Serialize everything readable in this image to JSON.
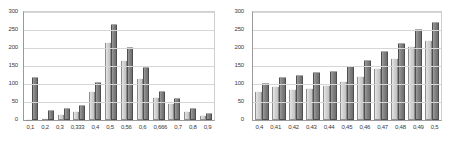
{
  "chart_data": [
    {
      "type": "bar",
      "title": "",
      "xlabel": "",
      "ylabel": "",
      "ylim": [
        0,
        300
      ],
      "yticks": [
        0,
        50,
        100,
        150,
        200,
        250,
        300
      ],
      "ytick_labels": [
        "0",
        "50",
        "100",
        "150",
        "200",
        "250",
        "300"
      ],
      "grid": true,
      "legend": "none",
      "categories": [
        "0,1",
        "0,2",
        "0,3",
        "0,333",
        "0,4",
        "0,5",
        "0,56",
        "0,6",
        "0,666",
        "0,7",
        "0,8",
        "0,9"
      ],
      "series": [
        {
          "name": "series-1",
          "color": "#d2d2d2",
          "values": [
            2,
            6,
            16,
            25,
            81,
            216,
            166,
            118,
            63,
            47,
            25,
            13
          ]
        },
        {
          "name": "series-2",
          "color": "#828282",
          "values": [
            119,
            27,
            34,
            43,
            105,
            266,
            203,
            147,
            80,
            61,
            32,
            20
          ]
        }
      ]
    },
    {
      "type": "bar",
      "title": "",
      "xlabel": "",
      "ylabel": "",
      "ylim": [
        0,
        300
      ],
      "yticks": [
        0,
        50,
        100,
        150,
        200,
        250,
        300
      ],
      "ytick_labels": [
        "0",
        "50",
        "100",
        "150",
        "200",
        "250",
        "300"
      ],
      "grid": true,
      "legend": "none",
      "categories": [
        "0,4",
        "0,41",
        "0,42",
        "0,43",
        "0,44",
        "0,45",
        "0,46",
        "0,47",
        "0,48",
        "0,49",
        "0,5"
      ],
      "series": [
        {
          "name": "series-1",
          "color": "#d2d2d2",
          "values": [
            81,
            95,
            86,
            90,
            97,
            108,
            123,
            144,
            171,
            206,
            221
          ]
        },
        {
          "name": "series-2",
          "color": "#828282",
          "values": [
            104,
            119,
            125,
            134,
            136,
            149,
            168,
            193,
            215,
            254,
            271
          ]
        }
      ]
    }
  ],
  "panels": {
    "left": {
      "name": "left-bar-chart"
    },
    "right": {
      "name": "right-bar-chart"
    }
  }
}
